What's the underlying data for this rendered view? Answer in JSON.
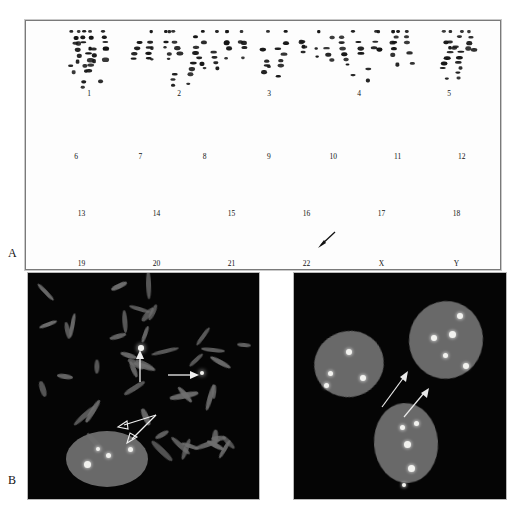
{
  "figure": {
    "panels": [
      {
        "letter": "A",
        "kind": "karyotype"
      },
      {
        "letter": "B",
        "kind": "fish-micrographs"
      }
    ]
  },
  "panel_a": {
    "letter": "A",
    "description": "G-banded karyotype, 46 chromosomes arranged in 4 rows",
    "rows": [
      {
        "labels": [
          "1",
          "2",
          "3",
          "4",
          "5"
        ]
      },
      {
        "labels": [
          "6",
          "7",
          "8",
          "9",
          "10",
          "11",
          "12"
        ]
      },
      {
        "labels": [
          "13",
          "14",
          "15",
          "16",
          "17",
          "18"
        ]
      },
      {
        "labels": [
          "19",
          "20",
          "21",
          "22",
          "X",
          "Y"
        ]
      }
    ],
    "annotations": [
      {
        "name": "chromosome-22-arrow",
        "target_label": "22",
        "direction": "down-left"
      }
    ]
  },
  "panel_b": {
    "letter": "B",
    "left_image": {
      "name": "metaphase-spread",
      "background": "#050505",
      "chromosome_color": "#6f6f6f",
      "signal_color": "#f2f2ef",
      "arrows": [
        {
          "name": "metaphase-arrow-up",
          "direction": "up"
        },
        {
          "name": "metaphase-arrow-right",
          "direction": "right"
        },
        {
          "name": "interphase-double-arrow",
          "direction": "double"
        }
      ]
    },
    "right_image": {
      "name": "interphase-nuclei",
      "background": "#050505",
      "nucleus_color": "#6a6a6a",
      "signal_color": "#f2f2ef",
      "nuclei_count": 3,
      "arrows": [
        {
          "name": "nucleus-arrow-left",
          "direction": "up-right"
        },
        {
          "name": "nucleus-arrow-right",
          "direction": "up-right"
        }
      ]
    }
  },
  "colors": {
    "page_background": "#ffffff",
    "karyotype_background": "#fdfdfd",
    "karyotype_border": "#7a7a7a",
    "chromosome_band": "#151515",
    "fish_background": "#050505",
    "fish_chromosome": "#6f6f6f",
    "fish_signal": "#f2f2ef"
  }
}
